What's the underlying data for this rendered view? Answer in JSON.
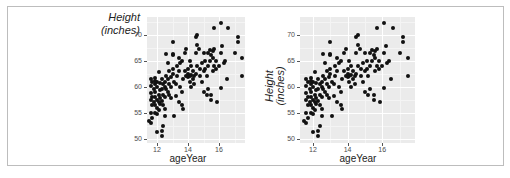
{
  "figure": {
    "panels": [
      {
        "id": "left",
        "ylabel_line1": "Height",
        "ylabel_line2": "(inches)",
        "ylabel_orientation": "horizontal",
        "xlabel": "ageYear"
      },
      {
        "id": "right",
        "ylabel_line1": "Height",
        "ylabel_line2": "(inches)",
        "ylabel_orientation": "rotated",
        "xlabel": "ageYear"
      }
    ],
    "yticks": [
      "70",
      "65",
      "60",
      "55",
      "50"
    ],
    "xticks": [
      "12",
      "14",
      "16"
    ]
  },
  "chart_data": [
    {
      "type": "scatter",
      "title": "",
      "xlabel": "ageYear",
      "ylabel": "Height (inches)",
      "ylabel_orientation": "horizontal",
      "xlim": [
        11.4,
        17.7
      ],
      "ylim": [
        49.3,
        73
      ],
      "xticks": [
        12,
        14,
        16
      ],
      "yticks": [
        50,
        55,
        60,
        65,
        70
      ],
      "grid": true,
      "background": "#ebebeb",
      "point_color": "#111111",
      "note": "approximate point positions read from the plot; both panels show the same data",
      "points": "shared"
    },
    {
      "type": "scatter",
      "title": "",
      "xlabel": "ageYear",
      "ylabel": "Height (inches)",
      "ylabel_orientation": "rotated 90deg",
      "xlim": [
        11.25,
        17.9
      ],
      "ylim": [
        49.3,
        73
      ],
      "xticks": [
        12,
        14,
        16
      ],
      "yticks": [
        50,
        55,
        60,
        65,
        70
      ],
      "grid": true,
      "background": "#ebebeb",
      "point_color": "#111111",
      "points": "shared"
    }
  ],
  "points": [
    [
      11.6,
      61.5
    ],
    [
      11.7,
      61.0
    ],
    [
      11.6,
      60.2
    ],
    [
      11.8,
      59.5
    ],
    [
      11.6,
      58.8
    ],
    [
      11.7,
      58.0
    ],
    [
      11.6,
      57.5
    ],
    [
      11.8,
      57.0
    ],
    [
      11.7,
      56.5
    ],
    [
      11.6,
      55.0
    ],
    [
      11.5,
      53.5
    ],
    [
      11.6,
      53.0
    ],
    [
      11.7,
      54.0
    ],
    [
      11.9,
      61.7
    ],
    [
      12.0,
      61.0
    ],
    [
      11.9,
      60.5
    ],
    [
      12.0,
      60.0
    ],
    [
      11.9,
      59.0
    ],
    [
      12.1,
      58.5
    ],
    [
      11.9,
      58.0
    ],
    [
      12.0,
      57.5
    ],
    [
      12.1,
      57.0
    ],
    [
      11.9,
      56.5
    ],
    [
      12.0,
      56.0
    ],
    [
      12.1,
      55.5
    ],
    [
      11.9,
      55.0
    ],
    [
      12.0,
      54.8
    ],
    [
      12.1,
      62.8
    ],
    [
      11.9,
      61.2
    ],
    [
      12.2,
      60.8
    ],
    [
      12.2,
      59.3
    ],
    [
      12.2,
      57.8
    ],
    [
      12.2,
      56.8
    ],
    [
      12.0,
      51.3
    ],
    [
      12.3,
      51.5
    ],
    [
      12.3,
      50.5
    ],
    [
      12.4,
      52.5
    ],
    [
      12.3,
      61.5
    ],
    [
      12.4,
      60.5
    ],
    [
      12.5,
      60.0
    ],
    [
      12.3,
      59.5
    ],
    [
      12.4,
      58.5
    ],
    [
      12.5,
      58.0
    ],
    [
      12.3,
      57.2
    ],
    [
      12.4,
      56.5
    ],
    [
      12.5,
      55.8
    ],
    [
      12.6,
      59.5
    ],
    [
      12.5,
      61.0
    ],
    [
      12.6,
      62.0
    ],
    [
      12.7,
      64.5
    ],
    [
      12.6,
      66.3
    ],
    [
      12.5,
      54.5
    ],
    [
      12.7,
      61.5
    ],
    [
      12.8,
      60.5
    ],
    [
      12.9,
      60.0
    ],
    [
      12.7,
      59.0
    ],
    [
      12.8,
      58.5
    ],
    [
      12.9,
      57.8
    ],
    [
      13.0,
      62.5
    ],
    [
      12.8,
      63.0
    ],
    [
      13.0,
      63.5
    ],
    [
      13.0,
      66.0
    ],
    [
      13.0,
      66.2
    ],
    [
      13.0,
      68.6
    ],
    [
      13.1,
      54.5
    ],
    [
      12.9,
      61.8
    ],
    [
      13.1,
      61.0
    ],
    [
      13.2,
      60.5
    ],
    [
      13.3,
      62.0
    ],
    [
      13.2,
      58.3
    ],
    [
      13.4,
      63.0
    ],
    [
      13.3,
      64.0
    ],
    [
      13.5,
      64.5
    ],
    [
      13.4,
      65.5
    ],
    [
      13.6,
      65.0
    ],
    [
      13.5,
      60.0
    ],
    [
      13.6,
      59.0
    ],
    [
      13.4,
      57.0
    ],
    [
      13.6,
      56.5
    ],
    [
      13.7,
      55.8
    ],
    [
      13.8,
      66.5
    ],
    [
      13.9,
      67.3
    ],
    [
      13.8,
      63.0
    ],
    [
      13.9,
      62.0
    ],
    [
      13.7,
      61.5
    ],
    [
      14.0,
      61.8
    ],
    [
      14.1,
      62.0
    ],
    [
      14.0,
      62.5
    ],
    [
      14.1,
      61.0
    ],
    [
      14.2,
      62.3
    ],
    [
      14.0,
      63.5
    ],
    [
      14.2,
      64.0
    ],
    [
      14.1,
      65.0
    ],
    [
      14.3,
      61.5
    ],
    [
      14.4,
      62.0
    ],
    [
      14.3,
      63.0
    ],
    [
      14.5,
      62.5
    ],
    [
      14.4,
      60.5
    ],
    [
      14.2,
      60.0
    ],
    [
      14.5,
      66.5
    ],
    [
      14.5,
      69.5
    ],
    [
      14.6,
      70.0
    ],
    [
      14.6,
      68.0
    ],
    [
      14.7,
      67.3
    ],
    [
      14.6,
      64.0
    ],
    [
      14.8,
      63.5
    ],
    [
      14.9,
      64.5
    ],
    [
      14.8,
      62.0
    ],
    [
      15.0,
      63.0
    ],
    [
      14.9,
      61.0
    ],
    [
      15.0,
      66.5
    ],
    [
      15.1,
      65.0
    ],
    [
      15.0,
      59.0
    ],
    [
      15.2,
      58.5
    ],
    [
      15.1,
      63.5
    ],
    [
      15.2,
      62.0
    ],
    [
      15.3,
      64.0
    ],
    [
      15.3,
      66.5
    ],
    [
      15.4,
      67.0
    ],
    [
      15.5,
      66.0
    ],
    [
      15.4,
      65.0
    ],
    [
      15.3,
      59.5
    ],
    [
      15.5,
      57.5
    ],
    [
      15.5,
      58.5
    ],
    [
      15.6,
      66.8
    ],
    [
      15.7,
      67.3
    ],
    [
      15.6,
      65.5
    ],
    [
      15.7,
      64.0
    ],
    [
      15.8,
      63.5
    ],
    [
      15.6,
      63.0
    ],
    [
      15.7,
      71.2
    ],
    [
      15.8,
      65.0
    ],
    [
      15.9,
      57.0
    ],
    [
      16.0,
      64.0
    ],
    [
      16.1,
      66.5
    ],
    [
      16.2,
      67.8
    ],
    [
      16.1,
      59.8
    ],
    [
      16.1,
      72.3
    ],
    [
      16.3,
      64.5
    ],
    [
      16.4,
      65.0
    ],
    [
      16.5,
      61.5
    ],
    [
      16.6,
      71.2
    ],
    [
      17.0,
      66.5
    ],
    [
      17.2,
      69.5
    ],
    [
      17.2,
      68.5
    ],
    [
      17.5,
      65.5
    ],
    [
      17.5,
      62.0
    ]
  ]
}
